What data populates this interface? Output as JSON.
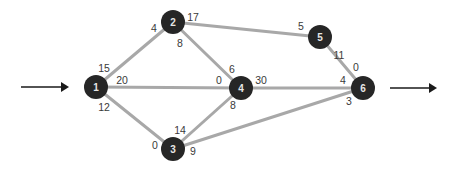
{
  "diagram": {
    "type": "network-flow-graph",
    "colors": {
      "edge": "#a8a8a8",
      "node": "#262626",
      "node_text": "#e6e6e6",
      "label_text": "#3a3a3a",
      "arrow": "#1a1a1a"
    },
    "nodes": [
      {
        "id": "1",
        "label": "1",
        "x": 96,
        "y": 87
      },
      {
        "id": "2",
        "label": "2",
        "x": 173,
        "y": 22
      },
      {
        "id": "3",
        "label": "3",
        "x": 173,
        "y": 149
      },
      {
        "id": "4",
        "label": "4",
        "x": 241,
        "y": 88
      },
      {
        "id": "5",
        "label": "5",
        "x": 320,
        "y": 37
      },
      {
        "id": "6",
        "label": "6",
        "x": 363,
        "y": 88
      }
    ],
    "edges": [
      {
        "from": "1",
        "to": "2",
        "from_value": "15",
        "to_value": "4"
      },
      {
        "from": "1",
        "to": "4",
        "from_value": "20",
        "to_value": "0"
      },
      {
        "from": "1",
        "to": "3",
        "from_value": "12",
        "to_value": "0"
      },
      {
        "from": "2",
        "to": "5",
        "from_value": "17",
        "to_value": "5"
      },
      {
        "from": "2",
        "to": "4",
        "from_value": "8",
        "to_value": "6"
      },
      {
        "from": "3",
        "to": "4",
        "from_value": "14",
        "to_value": "8"
      },
      {
        "from": "3",
        "to": "6",
        "from_value": "9",
        "to_value": "3"
      },
      {
        "from": "4",
        "to": "6",
        "from_value": "30",
        "to_value": "4"
      },
      {
        "from": "5",
        "to": "6",
        "from_value": "11",
        "to_value": "0"
      }
    ],
    "labels": [
      {
        "text": "15",
        "x": 104,
        "y": 68
      },
      {
        "text": "20",
        "x": 122,
        "y": 80
      },
      {
        "text": "12",
        "x": 104,
        "y": 107
      },
      {
        "text": "4",
        "x": 154,
        "y": 28
      },
      {
        "text": "17",
        "x": 193,
        "y": 17
      },
      {
        "text": "8",
        "x": 180,
        "y": 43
      },
      {
        "text": "0",
        "x": 219,
        "y": 80
      },
      {
        "text": "6",
        "x": 232,
        "y": 69
      },
      {
        "text": "30",
        "x": 261,
        "y": 80
      },
      {
        "text": "8",
        "x": 233,
        "y": 105
      },
      {
        "text": "14",
        "x": 180,
        "y": 130
      },
      {
        "text": "0",
        "x": 155,
        "y": 145
      },
      {
        "text": "9",
        "x": 193,
        "y": 151
      },
      {
        "text": "5",
        "x": 301,
        "y": 26
      },
      {
        "text": "11",
        "x": 339,
        "y": 55
      },
      {
        "text": "0",
        "x": 356,
        "y": 67
      },
      {
        "text": "4",
        "x": 343,
        "y": 80
      },
      {
        "text": "3",
        "x": 349,
        "y": 101
      }
    ],
    "input_arrow": {
      "x1": 21,
      "x2": 69,
      "y": 87
    },
    "output_arrow": {
      "x1": 390,
      "x2": 437,
      "y": 88
    }
  }
}
